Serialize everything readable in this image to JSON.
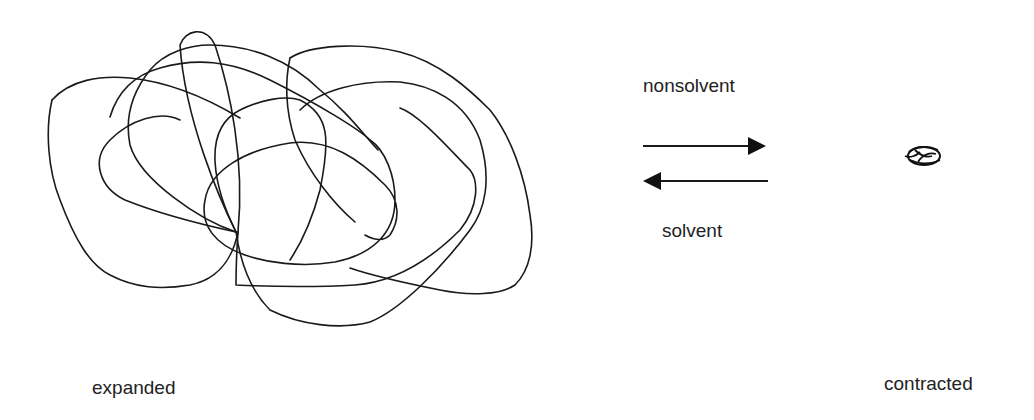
{
  "diagram": {
    "left_state": {
      "label": "expanded",
      "shape": "expanded-polymer-coil"
    },
    "right_state": {
      "label": "contracted",
      "shape": "contracted-polymer-globule"
    },
    "forward_arrow": {
      "direction": "right",
      "label": "nonsolvent"
    },
    "reverse_arrow": {
      "direction": "left",
      "label": "solvent"
    }
  }
}
